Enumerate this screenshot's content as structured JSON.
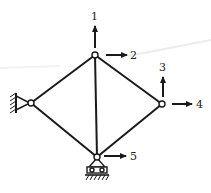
{
  "diagram": {
    "type": "truss",
    "colors": {
      "ink": "#1a1a1a",
      "background": "#ffffff",
      "artifact": "#e6e6e6"
    },
    "nodes": [
      {
        "id": "top",
        "x": 95,
        "y": 55,
        "type": "free"
      },
      {
        "id": "left",
        "x": 31,
        "y": 103,
        "type": "pin-wall"
      },
      {
        "id": "right",
        "x": 162,
        "y": 104,
        "type": "free"
      },
      {
        "id": "bottom",
        "x": 97,
        "y": 157,
        "type": "roller"
      }
    ],
    "members": [
      {
        "from": "left",
        "to": "top"
      },
      {
        "from": "top",
        "to": "right"
      },
      {
        "from": "right",
        "to": "bottom"
      },
      {
        "from": "bottom",
        "to": "left"
      },
      {
        "from": "top",
        "to": "bottom"
      }
    ],
    "dof_labels": {
      "d1": "1",
      "d2": "2",
      "d3": "3",
      "d4": "4",
      "d5": "5"
    },
    "dofs": [
      {
        "label": "1",
        "node": "top",
        "direction": "up"
      },
      {
        "label": "2",
        "node": "top",
        "direction": "right"
      },
      {
        "label": "3",
        "node": "right",
        "direction": "up"
      },
      {
        "label": "4",
        "node": "right",
        "direction": "right"
      },
      {
        "label": "5",
        "node": "bottom",
        "direction": "right"
      }
    ]
  }
}
